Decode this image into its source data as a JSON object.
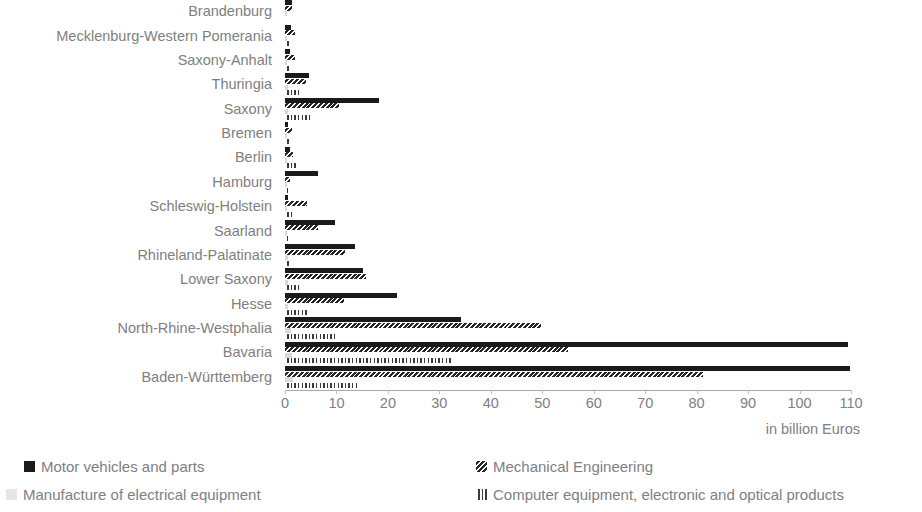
{
  "chart_data": {
    "type": "bar",
    "orientation": "horizontal",
    "title": "",
    "subtitle": "",
    "xlabel": "in billion Euros",
    "ylabel": "",
    "xlim": [
      0,
      110
    ],
    "xticks": [
      0,
      10,
      20,
      30,
      40,
      50,
      60,
      70,
      80,
      90,
      100,
      110
    ],
    "grid": false,
    "legend_position": "bottom",
    "categories": [
      "Brandenburg",
      "Mecklenburg-Western Pomerania",
      "Saxony-Anhalt",
      "Thuringia",
      "Saxony",
      "Bremen",
      "Berlin",
      "Hamburg",
      "Schleswig-Holstein",
      "Saarland",
      "Rhineland-Palatinate",
      "Lower Saxony",
      "Hesse",
      "North-Rhine-Westphalia",
      "Bavaria",
      "Baden-Württemberg"
    ],
    "series": [
      {
        "name": "Motor vehicles and parts",
        "color": "#1a1a1a",
        "pattern": "solid",
        "values": [
          1.3,
          1.1,
          1.0,
          4.6,
          18.2,
          0.6,
          0.9,
          6.5,
          0.5,
          9.8,
          13.6,
          15.2,
          21.8,
          34.2,
          109.5,
          109.8
        ]
      },
      {
        "name": "Mechanical Engineering",
        "color": "#262626",
        "pattern": "diagonal-hatch",
        "values": [
          1.4,
          1.9,
          2.0,
          4.1,
          10.4,
          1.3,
          1.6,
          1.0,
          4.3,
          6.4,
          11.6,
          15.8,
          11.4,
          49.8,
          55.0,
          81.2
        ]
      },
      {
        "name": "Manufacture of electrical equipment",
        "color": "#d9d9d9",
        "pattern": "solid-light",
        "values": [
          0.3,
          0.2,
          0.3,
          0.5,
          0.6,
          0.1,
          0.3,
          0.2,
          0.3,
          0.3,
          0.5,
          0.6,
          0.6,
          1.2,
          1.4,
          1.6
        ]
      },
      {
        "name": "Computer equipment, electronic and optical products",
        "color": "#3a3a3a",
        "pattern": "brick-hatch",
        "values": [
          0.4,
          1.0,
          1.1,
          2.7,
          5.3,
          0.9,
          2.2,
          0.6,
          1.4,
          0.6,
          1.2,
          3.4,
          4.3,
          10.3,
          32.5,
          14.2
        ]
      }
    ]
  },
  "axis": {
    "unit_label": "in billion Euros"
  }
}
